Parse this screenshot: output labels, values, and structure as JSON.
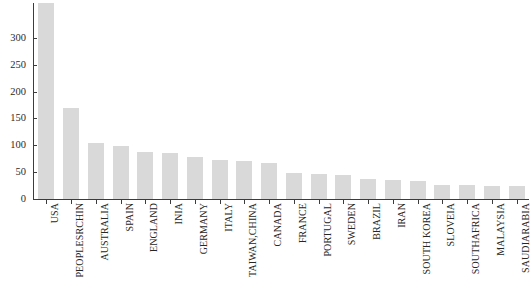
{
  "chart_data": {
    "type": "bar",
    "title": "",
    "subtitle": "",
    "xlabel": "",
    "ylabel": "",
    "ylim": [
      0,
      365
    ],
    "yticks": [
      0,
      50,
      100,
      150,
      200,
      250,
      300
    ],
    "ytick_labels": [
      "0",
      "50",
      "100",
      "150",
      "200",
      "250",
      "300"
    ],
    "grid": false,
    "legend": null,
    "bar_color": "#d9d9d9",
    "axis_color": "#3c3c3c",
    "text_color": "#262626",
    "categories": [
      "USA",
      "PEOPLESRCHIN",
      "AUSTRALIA",
      "SPAIN",
      "ENGLAND",
      "INIA",
      "GERMANY",
      "ITALY",
      "TAIWAN,CHINA",
      "CANADA",
      "FRANCE",
      "PORTUGAL",
      "SWEDEN",
      "BRAZIL",
      "IRAN",
      "SOUTH KOREA",
      "SLOVEIA",
      "SOUTHAFRICA",
      "MALAYSIA",
      "SAUDIARABIA"
    ],
    "values": [
      365,
      170,
      105,
      98,
      87,
      85,
      78,
      72,
      71,
      68,
      48,
      47,
      45,
      38,
      35,
      33,
      27,
      26,
      25,
      24
    ]
  }
}
